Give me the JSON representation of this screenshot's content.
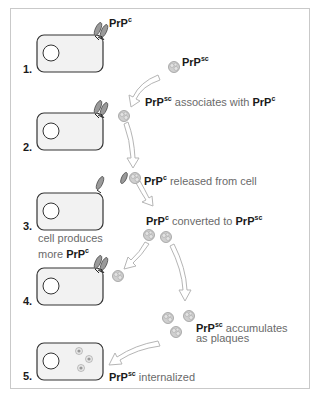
{
  "diagram": {
    "title": "",
    "steps": [
      {
        "number": "1.",
        "label": ""
      },
      {
        "number": "2.",
        "label": ""
      },
      {
        "number": "3.",
        "label": ""
      },
      {
        "number": "4.",
        "label": ""
      },
      {
        "number": "5.",
        "label": ""
      }
    ],
    "labels": {
      "prpc_top": {
        "base": "PrP",
        "sup": "c"
      },
      "prpsc_top": {
        "base": "PrP",
        "sup": "sc"
      },
      "associates": {
        "base": "PrP",
        "sup": "sc",
        "text": " associates with ",
        "base2": "PrP",
        "sup2": "c"
      },
      "released": {
        "base": "PrP",
        "sup": "c",
        "text": " released from cell"
      },
      "cell_produces_line1": "cell produces",
      "cell_produces_line2": {
        "text": "more ",
        "base": "PrP",
        "sup": "c"
      },
      "converted": {
        "base": "PrP",
        "sup": "c",
        "text": " converted to ",
        "base2": "PrP",
        "sup2": "sc"
      },
      "accumulates_line1": {
        "base": "PrP",
        "sup": "sc",
        "text": " accumulates"
      },
      "accumulates_line2": "as plaques",
      "internalized": {
        "base": "PrP",
        "sup": "sc",
        "text": " internalized"
      }
    },
    "colors": {
      "cell_fill": "#f2f2f2",
      "cell_stroke": "#333333",
      "prpc_fill": "#9a9a9a",
      "prpsc_fill": "#c8c8c8",
      "arrow_stroke": "#b5b5b5",
      "frame_border": "#c9c9c9"
    }
  }
}
